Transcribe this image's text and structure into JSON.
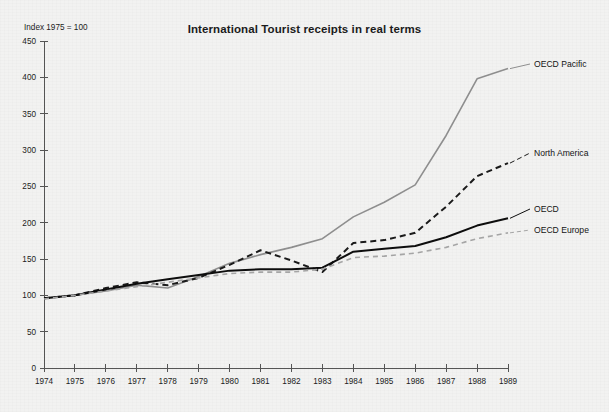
{
  "chart_data": {
    "type": "line",
    "title": "International Tourist receipts in real terms",
    "subtitle": "",
    "axis_note": "Index 1975 = 100",
    "xlabel": "",
    "ylabel": "",
    "grid": false,
    "legend_position": "right-inline-labels",
    "xlim": [
      1974,
      1989
    ],
    "ylim": [
      0,
      450
    ],
    "ytick_step": 50,
    "x": [
      1974,
      1975,
      1976,
      1977,
      1978,
      1979,
      1980,
      1981,
      1982,
      1983,
      1984,
      1985,
      1986,
      1987,
      1988,
      1989
    ],
    "ticks": {
      "y": [
        "0",
        "50",
        "100",
        "150",
        "200",
        "250",
        "300",
        "350",
        "400",
        "450"
      ],
      "x": [
        "1974",
        "1975",
        "1976",
        "1977",
        "1978",
        "1979",
        "1980",
        "1981",
        "1982",
        "1983",
        "1984",
        "1985",
        "1986",
        "1987",
        "1988",
        "1989"
      ]
    },
    "series": [
      {
        "name": "OECD Pacific",
        "label": "OECD Pacific",
        "color": "#8f8f8f",
        "style": "solid",
        "width": 1.6,
        "values": [
          96,
          100,
          106,
          114,
          110,
          126,
          144,
          156,
          166,
          178,
          208,
          228,
          252,
          320,
          398,
          412
        ]
      },
      {
        "name": "North America",
        "label": "North America",
        "color": "#1a1a1a",
        "style": "dashed",
        "width": 2.0,
        "values": [
          96,
          100,
          110,
          118,
          114,
          124,
          142,
          162,
          148,
          132,
          172,
          176,
          186,
          222,
          264,
          282
        ]
      },
      {
        "name": "OECD",
        "label": "OECD",
        "color": "#0d0d0d",
        "style": "solid",
        "width": 2.0,
        "values": [
          96,
          100,
          108,
          116,
          122,
          128,
          134,
          136,
          136,
          138,
          160,
          164,
          168,
          180,
          196,
          206
        ]
      },
      {
        "name": "OECD Europe",
        "label": "OECD Europe",
        "color": "#a6a6a6",
        "style": "dashed",
        "width": 1.6,
        "values": [
          95,
          100,
          106,
          112,
          118,
          124,
          130,
          132,
          132,
          136,
          152,
          154,
          158,
          166,
          178,
          186
        ]
      }
    ],
    "annotations": [
      {
        "text": "OECD Pacific",
        "series": "OECD Pacific"
      },
      {
        "text": "North America",
        "series": "North America"
      },
      {
        "text": "OECD",
        "series": "OECD"
      },
      {
        "text": "OECD Europe",
        "series": "OECD Europe"
      }
    ]
  }
}
